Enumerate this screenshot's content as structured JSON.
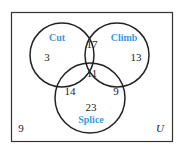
{
  "diagram": {
    "type": "venn-3",
    "universe_label": "U",
    "colors": {
      "outline": "#222222",
      "set_label": "#3a9ad9",
      "numbers": "#222222"
    },
    "sets": [
      {
        "name": "Cut"
      },
      {
        "name": "Climb"
      },
      {
        "name": "Splice"
      }
    ],
    "regions": {
      "cut_only": "3",
      "climb_only": "13",
      "splice_only": "23",
      "cut_climb_only": "17",
      "cut_splice_only": "14",
      "climb_splice_only": "9",
      "all_three": "11",
      "none": "9"
    }
  }
}
